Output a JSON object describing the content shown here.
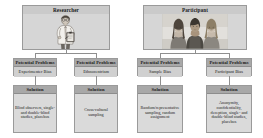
{
  "diagram": {
    "type": "flowchart",
    "title": "",
    "colors": {
      "box_fill": "#d8d8d8",
      "header_fill": "#a8a8a8",
      "border": "#9a9a9a",
      "connector": "#8f8f8f",
      "background": "#ffffff"
    },
    "branches": [
      {
        "id": "researcher",
        "source": {
          "label": "Researcher",
          "image": "researcher-with-clipboard-illustration"
        },
        "problems": [
          {
            "header": "Potential Problems",
            "label": "Experimenter Bias",
            "solution": {
              "header": "Solution",
              "label": "Blind observers, single- and double-blind studies, placebos"
            }
          },
          {
            "header": "Potential Problems",
            "label": "Ethnocentrism",
            "solution": {
              "header": "Solution",
              "label": "Cross-cultural sampling"
            }
          }
        ]
      },
      {
        "id": "participant",
        "source": {
          "label": "Participant",
          "image": "three-participants-photo"
        },
        "problems": [
          {
            "header": "Potential Problems",
            "label": "Sample Bias",
            "solution": {
              "header": "Solution",
              "label": "Random/representative sampling, random assignment"
            }
          },
          {
            "header": "Potential Problems",
            "label": "Participant Bias",
            "solution": {
              "header": "Solution",
              "label": "Anonymity, confidentiality, deception, single- and double-blind studies, placebos"
            }
          }
        ]
      }
    ]
  }
}
